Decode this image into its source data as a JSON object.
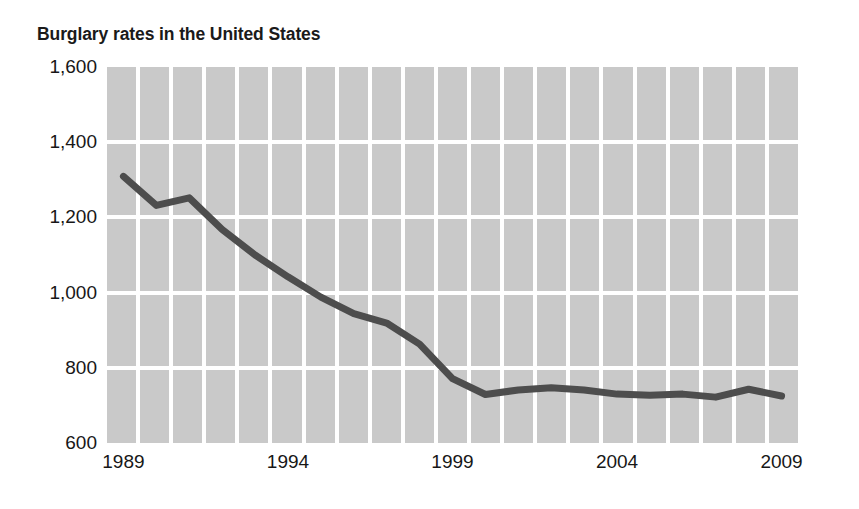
{
  "chart_data": {
    "type": "line",
    "title": "Burglary rates in the United States",
    "xlabel": "",
    "ylabel": "",
    "xlim": [
      1988.5,
      2009.5
    ],
    "ylim": [
      600,
      1600
    ],
    "grid": true,
    "legend": null,
    "y_ticks": [
      "1,600",
      "1,400",
      "1,200",
      "1,000",
      "800",
      "600"
    ],
    "y_tick_values": [
      1600,
      1400,
      1200,
      1000,
      800,
      600
    ],
    "x_ticks": [
      "1989",
      "1994",
      "1999",
      "2004",
      "2009"
    ],
    "x_tick_values": [
      1989,
      1994,
      1999,
      2004,
      2009
    ],
    "x": [
      1989,
      1990,
      1991,
      1992,
      1993,
      1994,
      1995,
      1996,
      1997,
      1998,
      1999,
      2000,
      2001,
      2002,
      2003,
      2004,
      2005,
      2006,
      2007,
      2008,
      2009
    ],
    "values": [
      1309,
      1232,
      1252,
      1168,
      1100,
      1042,
      988,
      944,
      919,
      863,
      771,
      729,
      741,
      747,
      741,
      730,
      727,
      730,
      722,
      743,
      725
    ],
    "series": [
      {
        "name": "Burglary rate per 100,000",
        "values": [
          1309,
          1232,
          1252,
          1168,
          1100,
          1042,
          988,
          944,
          919,
          863,
          771,
          729,
          741,
          747,
          741,
          730,
          727,
          730,
          722,
          743,
          725
        ]
      }
    ],
    "colors": {
      "line": "#4d4d4d",
      "band": "#c9c9c9",
      "grid": "#ffffff",
      "text": "#171717",
      "background": "#ffffff"
    },
    "band_count": 21
  }
}
